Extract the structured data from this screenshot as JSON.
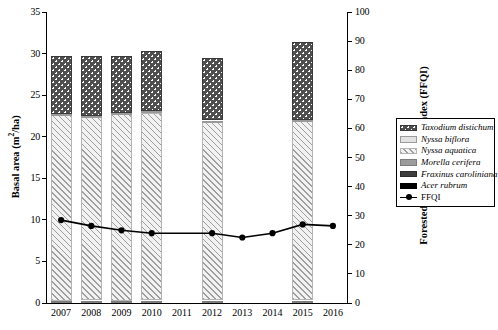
{
  "chart_data": {
    "type": "bar",
    "title": "",
    "subtitle": "",
    "xlabel": "",
    "ylabel": "Basal area (m2/ha)",
    "ylabel_display": "Basal area (m",
    "ylabel_sup": "2",
    "ylabel_tail": "/ha)",
    "y2label": "Forested Floristic Quality Index (FFQI)",
    "categories": [
      "2007",
      "2008",
      "2009",
      "2010",
      "2011",
      "2012",
      "2013",
      "2014",
      "2015",
      "2016"
    ],
    "ylim": [
      0,
      35
    ],
    "yticks": [
      0,
      5,
      10,
      15,
      20,
      25,
      30,
      35
    ],
    "y2lim": [
      0,
      100
    ],
    "y2ticks": [
      0,
      10,
      20,
      30,
      40,
      50,
      60,
      70,
      80,
      90,
      100
    ],
    "grid": false,
    "legend_position": "right",
    "stacked": true,
    "series": [
      {
        "name": "Taxodium distichum",
        "axis": "left",
        "style": "dark-dotted",
        "color": "#4f4f4f",
        "values": [
          6.9,
          7.1,
          6.9,
          7.2,
          null,
          7.5,
          null,
          null,
          9.4,
          null
        ]
      },
      {
        "name": "Nyssa biflora",
        "axis": "left",
        "style": "light-solid",
        "color": "#e2e2e2",
        "values": [
          0.15,
          0.15,
          0.15,
          0.15,
          null,
          0.15,
          null,
          null,
          0.15,
          null
        ]
      },
      {
        "name": "Nyssa aquatica",
        "axis": "left",
        "style": "light-hatch",
        "color": "#f2f2f2",
        "values": [
          22.3,
          22.1,
          22.4,
          22.6,
          null,
          21.5,
          null,
          null,
          21.6,
          null
        ]
      },
      {
        "name": "Morella cerifera",
        "axis": "left",
        "style": "gray-solid",
        "color": "#9c9c9c",
        "values": [
          0.05,
          0.05,
          0.05,
          0.05,
          null,
          0.05,
          null,
          null,
          0.05,
          null
        ]
      },
      {
        "name": "Fraxinus caroliniana",
        "axis": "left",
        "style": "dark-gray",
        "color": "#3d3d3d",
        "values": [
          0.05,
          0.05,
          0.05,
          0.05,
          null,
          0.05,
          null,
          null,
          0.05,
          null
        ]
      },
      {
        "name": "Acer rubrum",
        "axis": "left",
        "style": "black",
        "color": "#000000",
        "values": [
          0.2,
          0.2,
          0.2,
          0.2,
          null,
          0.2,
          null,
          null,
          0.2,
          null
        ]
      }
    ],
    "bar_totals": [
      29.65,
      29.6,
      29.7,
      30.15,
      null,
      29.3,
      null,
      null,
      31.4,
      null
    ],
    "line_series": {
      "name": "FFQI",
      "axis": "right",
      "color": "#000000",
      "marker": "circle",
      "x": [
        "2007",
        "2008",
        "2009",
        "2010",
        "2011",
        "2012",
        "2013",
        "2014",
        "2015",
        "2016"
      ],
      "values": [
        28.5,
        26.5,
        25.0,
        24.0,
        null,
        24.0,
        22.5,
        24.0,
        27.0,
        26.5
      ]
    }
  },
  "legend": {
    "items": [
      {
        "label": "Taxodium distichum",
        "style": "dark-dotted",
        "italic": true
      },
      {
        "label": "Nyssa biflora",
        "style": "light-solid",
        "italic": true
      },
      {
        "label": "Nyssa aquatica",
        "style": "light-hatch",
        "italic": true
      },
      {
        "label": "Morella cerifera",
        "style": "gray-solid",
        "italic": true
      },
      {
        "label": "Fraxinus caroliniana",
        "style": "dark-gray",
        "italic": true
      },
      {
        "label": "Acer rubrum",
        "style": "black",
        "italic": true
      },
      {
        "label": "FFQI",
        "style": "line-marker",
        "italic": false
      }
    ]
  }
}
